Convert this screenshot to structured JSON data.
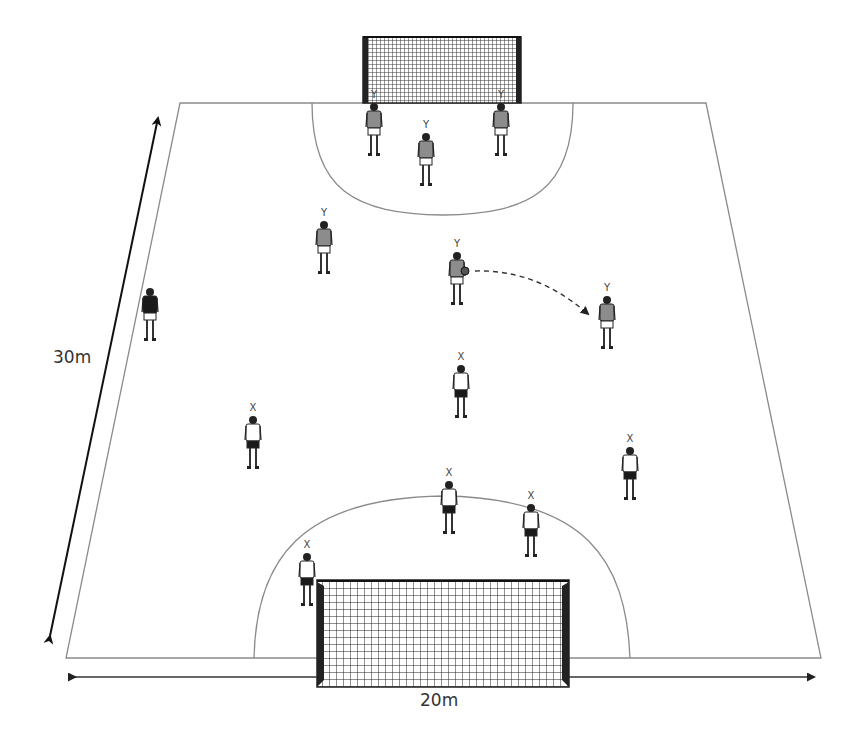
{
  "diagram": {
    "type": "handball-drill",
    "field": {
      "shape": "trapezoid",
      "corners": {
        "top_left": [
          180,
          103
        ],
        "top_right": [
          706,
          103
        ],
        "bottom_left": [
          66,
          658
        ],
        "bottom_right": [
          821,
          658
        ]
      },
      "line_color": "#8a8a8a"
    },
    "dimensions": {
      "length_label": "30m",
      "width_label": "20m"
    },
    "goals": [
      {
        "name": "top-goal",
        "x": 363,
        "y": 36,
        "w": 158,
        "h": 67
      },
      {
        "name": "bottom-goal",
        "x": 317,
        "y": 580,
        "w": 252,
        "h": 107
      }
    ],
    "team_labels": {
      "attack": "Y",
      "defense": "X"
    },
    "players": [
      {
        "team": "Y",
        "label": "Y",
        "x": 374,
        "y": 100,
        "shirt": "grey"
      },
      {
        "team": "Y",
        "label": "Y",
        "x": 426,
        "y": 130,
        "shirt": "grey"
      },
      {
        "team": "Y",
        "label": "Y",
        "x": 501,
        "y": 100,
        "shirt": "grey"
      },
      {
        "team": "Y",
        "label": "Y",
        "x": 324,
        "y": 218,
        "shirt": "grey"
      },
      {
        "team": "Y",
        "label": "Y",
        "x": 457,
        "y": 249,
        "shirt": "grey",
        "has_ball": true
      },
      {
        "team": "Y",
        "label": "Y",
        "x": 607,
        "y": 293,
        "shirt": "grey"
      },
      {
        "team": "X",
        "label": "X",
        "x": 461,
        "y": 362,
        "shirt": "white"
      },
      {
        "team": "X",
        "label": "X",
        "x": 253,
        "y": 413,
        "shirt": "white"
      },
      {
        "team": "X",
        "label": "X",
        "x": 630,
        "y": 444,
        "shirt": "white"
      },
      {
        "team": "X",
        "label": "X",
        "x": 449,
        "y": 478,
        "shirt": "white"
      },
      {
        "team": "X",
        "label": "X",
        "x": 531,
        "y": 501,
        "shirt": "white"
      },
      {
        "team": "X",
        "label": "X",
        "x": 307,
        "y": 550,
        "shirt": "white"
      },
      {
        "team": "ref",
        "label": "",
        "x": 150,
        "y": 285,
        "shirt": "black"
      }
    ],
    "pass": {
      "from": [
        475,
        271
      ],
      "to": [
        588,
        314
      ],
      "style": "dashed-arrow"
    }
  }
}
